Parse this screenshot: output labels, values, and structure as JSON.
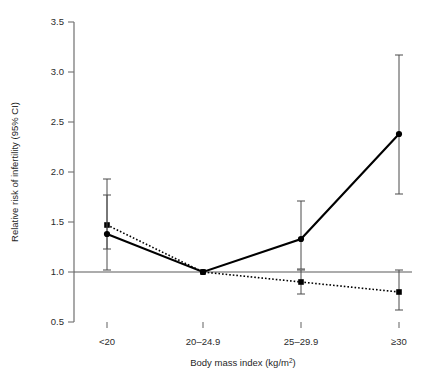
{
  "chart_data": {
    "type": "line",
    "title": "",
    "xlabel": "Body mass index (kg/m2)",
    "xlabel_base": "Body mass index (kg/m",
    "xlabel_sup": "2",
    "xlabel_tail": ")",
    "ylabel": "Relative risk of infertility (95% CI)",
    "categories": [
      "<20",
      "20–24.9",
      "25–29.9",
      "≥30"
    ],
    "x": [
      1,
      2,
      3,
      4
    ],
    "ylim": [
      0.5,
      3.5
    ],
    "yticks": [
      0.5,
      1.0,
      1.5,
      2.0,
      2.5,
      3.0,
      3.5
    ],
    "ytick_labels": [
      "0.5",
      "1.0",
      "1.5",
      "2.0",
      "2.5",
      "3.0",
      "3.5"
    ],
    "grid": false,
    "legend": "none",
    "reference_line": 1.0,
    "series": [
      {
        "name": "solid-circle-series",
        "line_style": "solid",
        "marker": "circle",
        "color": "#000000",
        "values": [
          1.38,
          1.0,
          1.33,
          2.38
        ],
        "ci_low": [
          1.02,
          null,
          1.03,
          1.78
        ],
        "ci_high": [
          1.93,
          null,
          1.71,
          3.17
        ],
        "labels": [
          "1.38 (1.02–1.93)",
          "1.00 (reference)",
          "1.33 (1.03–1.71)",
          "2.38 (1.78–3.17)"
        ]
      },
      {
        "name": "dotted-square-series",
        "line_style": "dotted",
        "marker": "square",
        "color": "#000000",
        "values": [
          1.47,
          1.0,
          0.9,
          0.8
        ],
        "ci_low": [
          1.23,
          null,
          0.78,
          0.62
        ],
        "ci_high": [
          1.77,
          null,
          1.02,
          1.02
        ],
        "labels": [
          "1.47 (1.23–1.77)",
          "1.00 (reference)",
          "0.90 (0.78–1.02)",
          "0.80 (0.62–1.02)"
        ]
      }
    ]
  },
  "axes": {
    "y_title": "Relative risk of infertility (95% CI)",
    "x_title_full": "Body mass index (kg/m2)"
  }
}
